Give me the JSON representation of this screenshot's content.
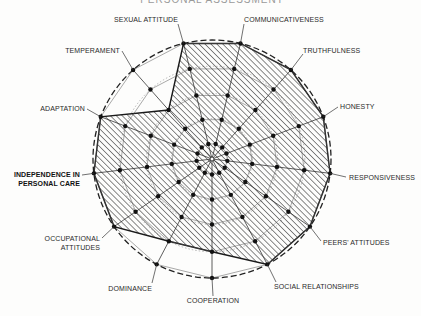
{
  "chart_data": {
    "type": "radar",
    "title": "PERSONAL ASSESSMENT",
    "scale_max": 5,
    "rings": 5,
    "grid": true,
    "fill_pattern": "diagonal-hatch",
    "axes": [
      {
        "label": "COOPERATION",
        "value": 4
      },
      {
        "label": "SOCIAL RELATIONSHIPS",
        "value": 5
      },
      {
        "label": "PEERS' ATTITUDES",
        "value": 5
      },
      {
        "label": "RESPONSIVENESS",
        "value": 5
      },
      {
        "label": "HONESTY",
        "value": 5
      },
      {
        "label": "TRUTHFULNESS",
        "value": 5
      },
      {
        "label": "COMMUNICATIVENESS",
        "value": 5
      },
      {
        "label": "SEXUAL ATTITUDE",
        "value": 5
      },
      {
        "label": "TEMPERAMENT",
        "value": 3
      },
      {
        "label": "ADAPTATION",
        "value": 5
      },
      {
        "label": "INDEPENDENCE IN PERSONAL CARE",
        "value": 5
      },
      {
        "label": "OCCUPATIONAL ATTITUDES",
        "value": 5
      },
      {
        "label": "DOMINANCE",
        "value": 4
      }
    ],
    "label_positions": [
      {
        "lines": [
          "COOPERATION"
        ],
        "x": 213,
        "y": 303,
        "anchor": "middle",
        "lx": 213,
        "ly": 296
      },
      {
        "lines": [
          "SOCIAL RELATIONSHIPS"
        ],
        "x": 274,
        "y": 289,
        "anchor": "start",
        "lx": 276,
        "ly": 282
      },
      {
        "lines": [
          "PEERS' ATTITUDES"
        ],
        "x": 323,
        "y": 245,
        "anchor": "start",
        "lx": 321,
        "ly": 241
      },
      {
        "lines": [
          "RESPONSIVENESS"
        ],
        "x": 349,
        "y": 180,
        "anchor": "start",
        "lx": 346,
        "ly": 177
      },
      {
        "lines": [
          "HONESTY"
        ],
        "x": 340,
        "y": 109,
        "anchor": "start",
        "lx": 338,
        "ly": 107
      },
      {
        "lines": [
          "TRUTHFULNESS"
        ],
        "x": 303,
        "y": 53,
        "anchor": "start",
        "lx": 303,
        "ly": 54
      },
      {
        "lines": [
          "COMMUNICATIVENESS"
        ],
        "x": 244,
        "y": 22,
        "anchor": "start",
        "lx": 244,
        "ly": 24
      },
      {
        "lines": [
          "SEXUAL ATTITUDE"
        ],
        "x": 178,
        "y": 22,
        "anchor": "end",
        "lx": 178,
        "ly": 24
      },
      {
        "lines": [
          "TEMPERAMENT"
        ],
        "x": 120,
        "y": 53,
        "anchor": "end",
        "lx": 122,
        "ly": 51
      },
      {
        "lines": [
          "ADAPTATION"
        ],
        "x": 85,
        "y": 111,
        "anchor": "end",
        "lx": 87,
        "ly": 109
      },
      {
        "lines": [
          "INDEPENDENCE IN",
          "PERSONAL CARE"
        ],
        "x": 80,
        "y": 177,
        "anchor": "end",
        "lx": 82,
        "ly": 175,
        "bold": true
      },
      {
        "lines": [
          "OCCUPATIONAL",
          "ATTITUDES"
        ],
        "x": 100,
        "y": 241,
        "anchor": "end",
        "lx": 102,
        "ly": 238
      },
      {
        "lines": [
          "DOMINANCE"
        ],
        "x": 152,
        "y": 291,
        "anchor": "end",
        "lx": 152,
        "ly": 283
      }
    ],
    "center": [
      212,
      159
    ],
    "radius": 119
  }
}
